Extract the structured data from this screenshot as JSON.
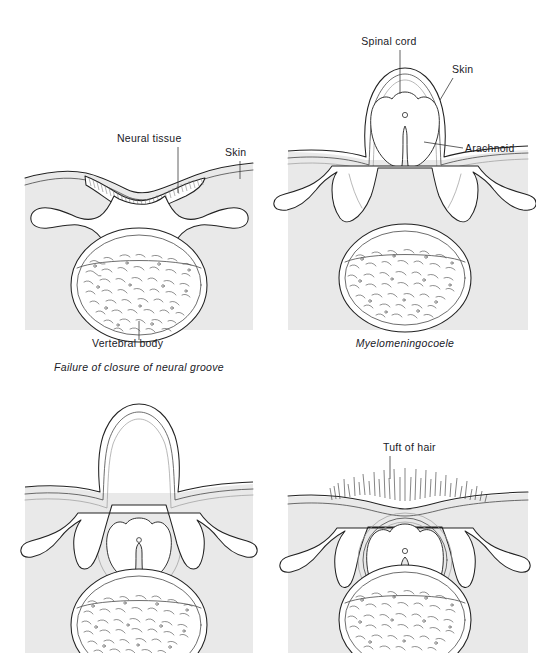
{
  "figure": {
    "title_visible": false,
    "background_color": "#ffffff",
    "tissue_shade_color": "#e9e9e9",
    "line_color": "#222222",
    "label_color": "#20201f"
  },
  "panels": [
    {
      "id": "panel-top-left",
      "caption": "Failure of closure of neural groove",
      "has_caption": true,
      "labels": [
        {
          "name": "neural-tissue",
          "text": "Neural tissue"
        },
        {
          "name": "skin",
          "text": "Skin"
        },
        {
          "name": "vertebral-body",
          "text": "Vertebral body"
        }
      ]
    },
    {
      "id": "panel-top-right",
      "caption": "Myelomeningocoele",
      "has_caption": true,
      "labels": [
        {
          "name": "spinal-cord",
          "text": "Spinal cord"
        },
        {
          "name": "skin",
          "text": "Skin"
        },
        {
          "name": "arachnoid",
          "text": "Arachnoid"
        }
      ]
    },
    {
      "id": "panel-bottom-left",
      "caption": "",
      "has_caption": false,
      "labels": []
    },
    {
      "id": "panel-bottom-right",
      "caption": "",
      "has_caption": false,
      "labels": [
        {
          "name": "tuft-of-hair",
          "text": "Tuft of hair"
        }
      ]
    }
  ],
  "labels_flat": {
    "neural_tissue": "Neural tissue",
    "skin_left": "Skin",
    "vertebral_body": "Vertebral body",
    "spinal_cord": "Spinal cord",
    "skin_right": "Skin",
    "arachnoid": "Arachnoid",
    "tuft_of_hair": "Tuft of hair"
  },
  "captions": {
    "top_left": "Failure of closure of neural groove",
    "top_right": "Myelomeningocoele"
  }
}
